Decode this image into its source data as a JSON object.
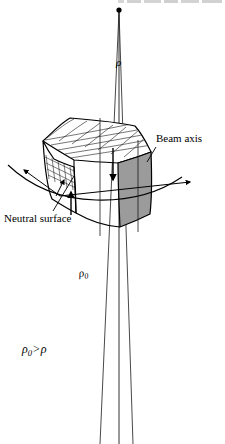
{
  "figure": {
    "type": "technical-line-diagram",
    "background_color": "#ffffff",
    "ink_color": "#000000",
    "shaded_face_color": "#9b9b9b",
    "top_face_color": "#ffffff",
    "left_face_color": "#fdfdfd"
  },
  "labels": {
    "beam_axis": "Beam axis",
    "neutral_surface": "Neutral surface",
    "rho": "ρ",
    "rho_zero_symbol": "ρ",
    "rho_zero_subscript": "0",
    "inequality_lhs": "ρ",
    "inequality_lhs_sub": "0",
    "inequality_operator": ">",
    "inequality_rhs": "ρ"
  },
  "geometry": {
    "apex": {
      "x": 119,
      "y": 10,
      "marker": "filled-dot",
      "radius": 2.6
    },
    "radius_lines": [
      {
        "name": "rho-line",
        "from": [
          119,
          10
        ],
        "to": [
          119,
          444
        ]
      },
      {
        "name": "rho-zero-line-left",
        "from": [
          119,
          10
        ],
        "to": [
          103,
          444
        ]
      },
      {
        "name": "rho-zero-line-right",
        "from": [
          119,
          10
        ],
        "to": [
          131,
          444
        ]
      }
    ],
    "block": {
      "top_face_mesh_columns": 7,
      "top_face_mesh_rows": 5,
      "left_face_mesh_columns": 5,
      "left_face_mesh_rows": 3
    },
    "arrows": [
      {
        "name": "down-arrow-on-shaded-face",
        "direction": "down"
      },
      {
        "name": "up-arrow-front-bottom",
        "direction": "up"
      },
      {
        "name": "beam-axis-arrow-right",
        "direction": "right"
      },
      {
        "name": "beam-axis-arrow-left",
        "direction": "left"
      }
    ],
    "leaders": [
      {
        "name": "beam-axis-leader",
        "from": [
          155,
          146
        ],
        "to": [
          140,
          166
        ]
      },
      {
        "name": "neutral-surface-leader",
        "from": [
          52,
          211
        ],
        "to": [
          72,
          176
        ]
      }
    ]
  },
  "cropped_header": {
    "present": true,
    "note": "bottom sliver of a cropped line of text at very top of image"
  }
}
